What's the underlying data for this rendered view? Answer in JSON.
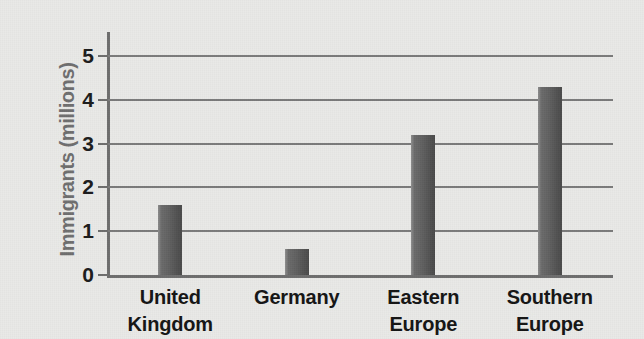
{
  "chart_data": {
    "type": "bar",
    "title": "",
    "xlabel": "",
    "ylabel": "Immigrants (millions)",
    "categories": [
      "United Kingdom",
      "Germany",
      "Eastern Europe",
      "Southern Europe"
    ],
    "category_lines": [
      [
        "United",
        "Kingdom"
      ],
      [
        "Germany",
        ""
      ],
      [
        "Eastern",
        "Europe"
      ],
      [
        "Southern",
        "Europe"
      ]
    ],
    "values": [
      1.6,
      0.6,
      3.2,
      4.3
    ],
    "ylim": [
      0,
      5
    ],
    "yticks": [
      0,
      1,
      2,
      3,
      4,
      5
    ],
    "ytick_labels": [
      "0",
      "1",
      "2",
      "3",
      "4",
      "5"
    ],
    "grid": true,
    "legend": false,
    "bar_color": "#5f5f5f",
    "axis_color": "#6d6d6d",
    "grid_color": "#7a7a7a",
    "background_color": "#e9e9e7",
    "label_color": "#141414",
    "ylabel_color": "#6e6e6e"
  }
}
